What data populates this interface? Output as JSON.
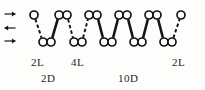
{
  "figure": {
    "type": "polymer-chain-schematic",
    "background_color": "#fdfdfb",
    "stroke_color": "#141414",
    "node_fill": "#ffffff",
    "width": 205,
    "height": 90
  },
  "arrows": [
    {
      "name": "arrow-top",
      "direction": "right",
      "glyph": "→",
      "x": 10,
      "y": 14
    },
    {
      "name": "arrow-middle",
      "direction": "left",
      "glyph": "←",
      "x": 10,
      "y": 28
    },
    {
      "name": "arrow-bottom",
      "direction": "right",
      "glyph": "→",
      "x": 10,
      "y": 41
    }
  ],
  "nodes": {
    "radius": 4.0,
    "top_row_y": 15,
    "bottom_row_y": 42,
    "top_row": [
      {
        "id": "t1",
        "x": 34,
        "paired": false
      },
      {
        "id": "t2a",
        "x": 59,
        "paired": true
      },
      {
        "id": "t2b",
        "x": 67,
        "paired": true
      },
      {
        "id": "t3a",
        "x": 89,
        "paired": true
      },
      {
        "id": "t3b",
        "x": 97,
        "paired": true
      },
      {
        "id": "t4a",
        "x": 119,
        "paired": true
      },
      {
        "id": "t4b",
        "x": 127,
        "paired": true
      },
      {
        "id": "t5a",
        "x": 149,
        "paired": true
      },
      {
        "id": "t5b",
        "x": 157,
        "paired": true
      },
      {
        "id": "t6",
        "x": 181,
        "paired": false
      }
    ],
    "bottom_row": [
      {
        "id": "b1a",
        "x": 43,
        "paired": true
      },
      {
        "id": "b1b",
        "x": 51,
        "paired": true
      },
      {
        "id": "b2a",
        "x": 74,
        "paired": true
      },
      {
        "id": "b2b",
        "x": 82,
        "paired": true
      },
      {
        "id": "b3a",
        "x": 104,
        "paired": true
      },
      {
        "id": "b3b",
        "x": 112,
        "paired": true
      },
      {
        "id": "b4a",
        "x": 134,
        "paired": true
      },
      {
        "id": "b4b",
        "x": 142,
        "paired": true
      },
      {
        "id": "b5a",
        "x": 164,
        "paired": true
      },
      {
        "id": "b5b",
        "x": 172,
        "paired": true
      }
    ]
  },
  "bonds": [
    {
      "id": "s1",
      "from": "t1",
      "to": "b1a",
      "style": "thin"
    },
    {
      "id": "s2",
      "from": "b1b",
      "to": "t2a",
      "style": "thick"
    },
    {
      "id": "s3",
      "from": "t2b",
      "to": "b2a",
      "style": "thin"
    },
    {
      "id": "s4",
      "from": "b2b",
      "to": "t3a",
      "style": "thin"
    },
    {
      "id": "s5",
      "from": "t3b",
      "to": "b3a",
      "style": "thick"
    },
    {
      "id": "s6",
      "from": "b3b",
      "to": "t4a",
      "style": "thick"
    },
    {
      "id": "s7",
      "from": "t4b",
      "to": "b4a",
      "style": "thick"
    },
    {
      "id": "s8",
      "from": "b4b",
      "to": "t5a",
      "style": "thick"
    },
    {
      "id": "s9",
      "from": "t5b",
      "to": "b5a",
      "style": "thick"
    },
    {
      "id": "s10",
      "from": "b5b",
      "to": "t6",
      "style": "thin"
    }
  ],
  "labels": {
    "row_upper": [
      {
        "name": "label-2L-left",
        "text": "2L",
        "x": 31,
        "y": 57
      },
      {
        "name": "label-4L",
        "text": "4L",
        "x": 71,
        "y": 57
      },
      {
        "name": "label-2L-right",
        "text": "2L",
        "x": 172,
        "y": 57
      }
    ],
    "row_lower": [
      {
        "name": "label-2D",
        "text": "2D",
        "x": 41,
        "y": 73
      },
      {
        "name": "label-10D",
        "text": "10D",
        "x": 118,
        "y": 73
      }
    ]
  }
}
